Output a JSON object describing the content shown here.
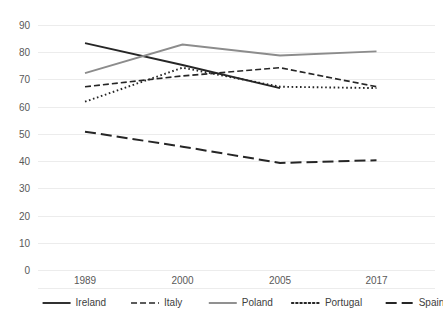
{
  "chart_data": {
    "type": "line",
    "title": "",
    "subtitle": "",
    "xlabel": "",
    "ylabel": "",
    "categories": [
      "1989",
      "2000",
      "2005",
      "2017"
    ],
    "ylim": [
      0,
      90
    ],
    "yticks": [
      0,
      10,
      20,
      30,
      40,
      50,
      60,
      70,
      80,
      90
    ],
    "ytick_labels": [
      "0",
      "10",
      "20",
      "30",
      "40",
      "50",
      "60",
      "70",
      "80",
      "90"
    ],
    "grid": true,
    "grid_axis": "y",
    "legend_position": "bottom",
    "series": [
      {
        "name": "Ireland",
        "values": [
          83.5,
          75.5,
          67.0,
          null
        ],
        "style": "solid",
        "color": "#262626"
      },
      {
        "name": "Italy",
        "values": [
          67.5,
          71.5,
          74.5,
          67.5
        ],
        "style": "dashed",
        "color": "#262626"
      },
      {
        "name": "Poland",
        "values": [
          72.5,
          83.0,
          79.0,
          80.5
        ],
        "style": "solid",
        "color": "#8c8c8c"
      },
      {
        "name": "Portugal",
        "values": [
          62.0,
          74.5,
          67.5,
          67.0
        ],
        "style": "dotted",
        "color": "#262626"
      },
      {
        "name": "Spain",
        "values": [
          51.0,
          45.5,
          39.5,
          40.5
        ],
        "style": "long-dash",
        "color": "#262626"
      }
    ]
  },
  "legend": {
    "items": [
      {
        "label": "Ireland"
      },
      {
        "label": "Italy"
      },
      {
        "label": "Poland"
      },
      {
        "label": "Portugal"
      },
      {
        "label": "Spain"
      }
    ]
  },
  "colors": {
    "gridline": "#ececec",
    "tick_text": "#595959",
    "legend_text": "#404040",
    "background": "#ffffff"
  }
}
